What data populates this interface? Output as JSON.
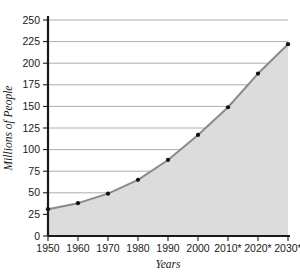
{
  "chart_data": {
    "type": "area",
    "title": "",
    "xlabel": "Years",
    "ylabel": "Millions of People",
    "categories": [
      "1950",
      "1960",
      "1970",
      "1980",
      "1990",
      "2000",
      "2010*",
      "2020*",
      "2030*"
    ],
    "values": [
      31,
      38,
      49,
      65,
      88,
      117,
      149,
      188,
      222
    ],
    "x_tick_labels": [
      "1950",
      "1960",
      "1970",
      "1980",
      "1990",
      "2000",
      "2010*",
      "2020*",
      "2030*"
    ],
    "y_tick_labels": [
      "0",
      "25",
      "50",
      "75",
      "100",
      "125",
      "150",
      "175",
      "200",
      "225",
      "250"
    ],
    "y_tick_values": [
      0,
      25,
      50,
      75,
      100,
      125,
      150,
      175,
      200,
      225,
      250
    ],
    "ylim": [
      0,
      250
    ],
    "grid": true,
    "legend": "none",
    "series": [
      {
        "name": "Population",
        "values": [
          31,
          38,
          49,
          65,
          88,
          117,
          149,
          188,
          222
        ]
      }
    ],
    "colors": {
      "area_fill": "#dcdcdc",
      "line": "#8a8a8a",
      "marker": "#111111",
      "gridline": "#9a9a9a",
      "axis": "#1a1a1a",
      "background": "#ffffff"
    },
    "note": "* indicates projected values"
  }
}
